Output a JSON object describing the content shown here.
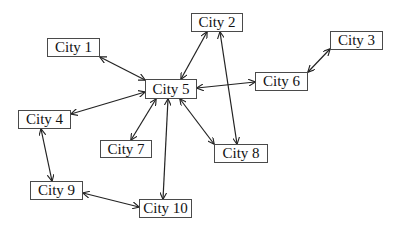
{
  "diagram": {
    "type": "undirected network graph with bidirectional arrows",
    "nodes": [
      {
        "id": "city1",
        "label": "City 1",
        "x": 47,
        "y": 38,
        "w": 53,
        "h": 19
      },
      {
        "id": "city2",
        "label": "City 2",
        "x": 191,
        "y": 13,
        "w": 52,
        "h": 19
      },
      {
        "id": "city3",
        "label": "City 3",
        "x": 330,
        "y": 31,
        "w": 53,
        "h": 19
      },
      {
        "id": "city4",
        "label": "City 4",
        "x": 18,
        "y": 110,
        "w": 53,
        "h": 19
      },
      {
        "id": "city5",
        "label": "City 5",
        "x": 145,
        "y": 79,
        "w": 52,
        "h": 20
      },
      {
        "id": "city6",
        "label": "City 6",
        "x": 255,
        "y": 72,
        "w": 53,
        "h": 19
      },
      {
        "id": "city7",
        "label": "City 7",
        "x": 100,
        "y": 140,
        "w": 52,
        "h": 18
      },
      {
        "id": "city8",
        "label": "City 8",
        "x": 214,
        "y": 144,
        "w": 54,
        "h": 19
      },
      {
        "id": "city9",
        "label": "City 9",
        "x": 30,
        "y": 181,
        "w": 53,
        "h": 19
      },
      {
        "id": "city10",
        "label": "City 10",
        "x": 139,
        "y": 199,
        "w": 53,
        "h": 19
      }
    ],
    "edges": [
      {
        "from": "city1",
        "to": "city5",
        "x1": 100,
        "y1": 57,
        "x2": 145,
        "y2": 80,
        "bidirectional": true
      },
      {
        "from": "city2",
        "to": "city5",
        "x1": 207,
        "y1": 32,
        "x2": 181,
        "y2": 79,
        "bidirectional": true
      },
      {
        "from": "city2",
        "to": "city8",
        "x1": 220,
        "y1": 32,
        "x2": 237,
        "y2": 144,
        "bidirectional": true
      },
      {
        "from": "city3",
        "to": "city6",
        "x1": 330,
        "y1": 49,
        "x2": 308,
        "y2": 72,
        "bidirectional": true
      },
      {
        "from": "city5",
        "to": "city6",
        "x1": 197,
        "y1": 88,
        "x2": 255,
        "y2": 82,
        "bidirectional": true
      },
      {
        "from": "city4",
        "to": "city5",
        "x1": 71,
        "y1": 114,
        "x2": 145,
        "y2": 92,
        "bidirectional": true
      },
      {
        "from": "city4",
        "to": "city9",
        "x1": 41,
        "y1": 129,
        "x2": 52,
        "y2": 181,
        "bidirectional": true
      },
      {
        "from": "city5",
        "to": "city7",
        "x1": 156,
        "y1": 99,
        "x2": 131,
        "y2": 140,
        "bidirectional": true
      },
      {
        "from": "city5",
        "to": "city8",
        "x1": 180,
        "y1": 99,
        "x2": 214,
        "y2": 144,
        "bidirectional": true
      },
      {
        "from": "city5",
        "to": "city10",
        "x1": 168,
        "y1": 99,
        "x2": 163,
        "y2": 199,
        "bidirectional": true
      },
      {
        "from": "city9",
        "to": "city10",
        "x1": 83,
        "y1": 193,
        "x2": 139,
        "y2": 207,
        "bidirectional": true
      }
    ],
    "colors": {
      "edge": "#222222",
      "node_border": "#4a4a4a",
      "node_fill": "#ffffff",
      "text": "#111111"
    }
  }
}
